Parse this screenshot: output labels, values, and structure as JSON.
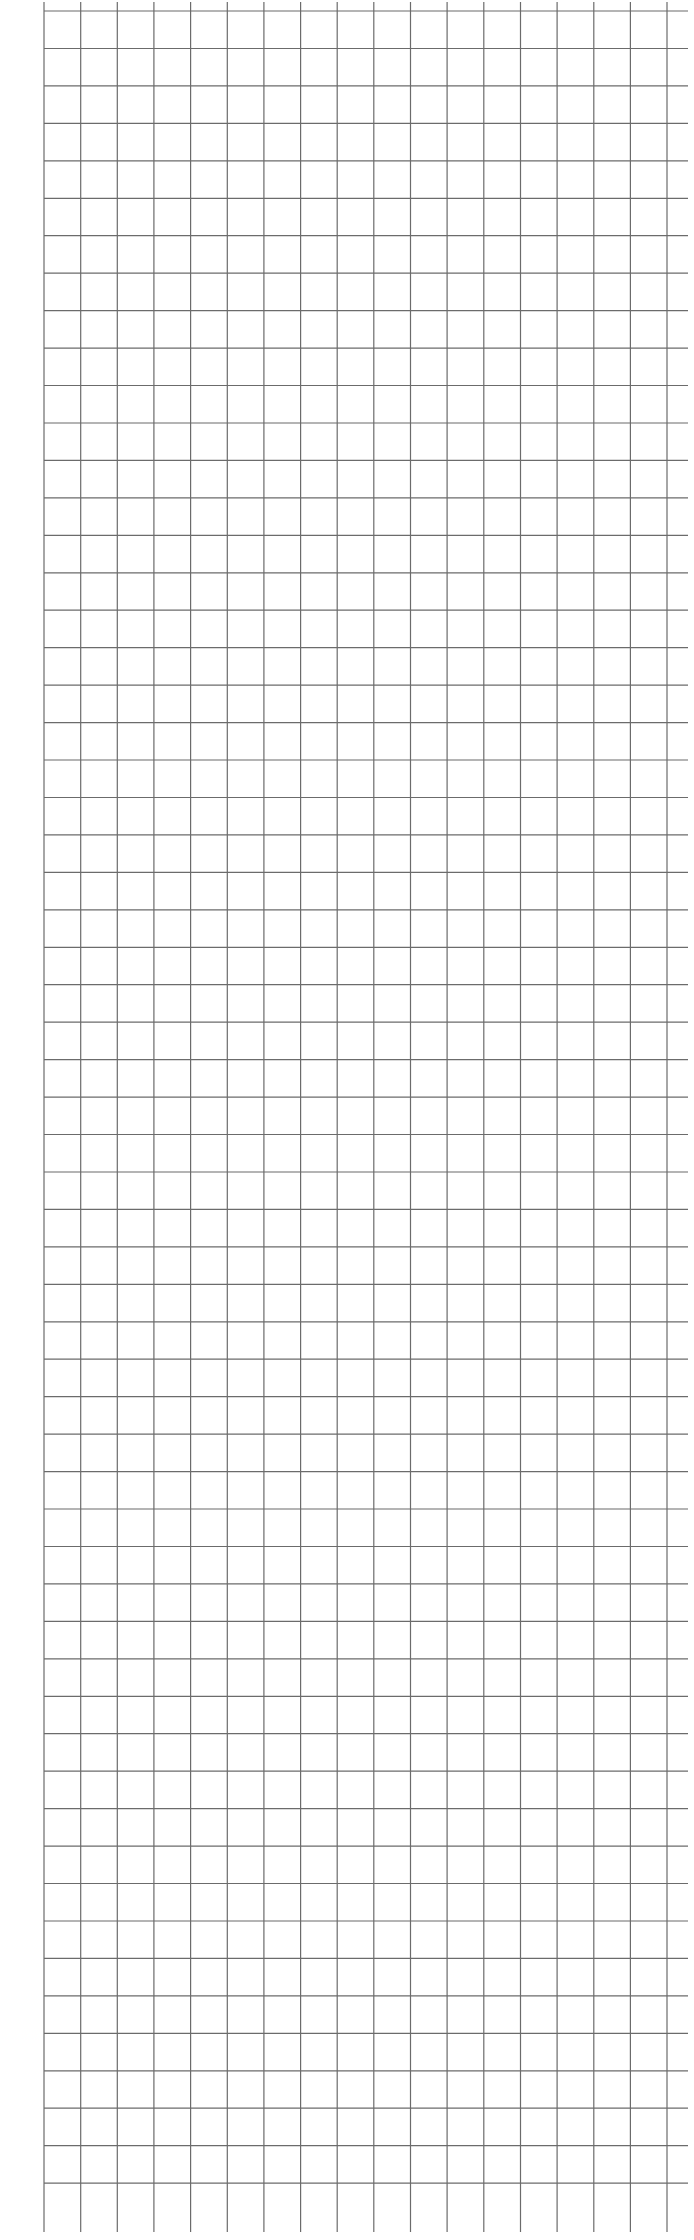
{
  "sheet": {
    "type": "graph-paper",
    "background": "#ffffff",
    "line_color": "#6b6b6b",
    "grid": {
      "x_start": 44,
      "x_spacing": 36.65,
      "vertical_lines": 18,
      "y_start": 11,
      "y_spacing": 37.45,
      "horizontal_lines": 59,
      "h_line_end_x": 688,
      "v_line_top": 2,
      "v_line_bottom": 2232
    }
  },
  "edge_marks": [
    {
      "y": 262,
      "glyph": "|"
    },
    {
      "y": 282,
      "glyph": "·"
    },
    {
      "y": 344,
      "glyph": "·"
    },
    {
      "y": 940,
      "glyph": "|"
    },
    {
      "y": 990,
      "glyph": "·"
    },
    {
      "y": 1032,
      "glyph": "·"
    },
    {
      "y": 1074,
      "glyph": "·"
    },
    {
      "y": 1128,
      "glyph": "·"
    },
    {
      "y": 1172,
      "glyph": "|"
    },
    {
      "y": 1216,
      "glyph": "·"
    },
    {
      "y": 1260,
      "glyph": "|"
    },
    {
      "y": 1380,
      "glyph": "·"
    }
  ]
}
